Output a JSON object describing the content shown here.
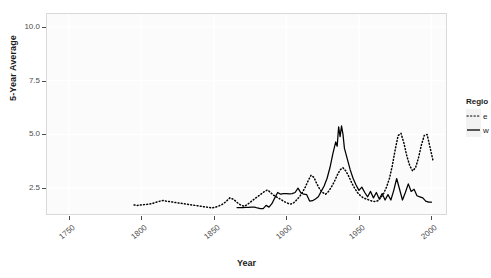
{
  "chart_data": {
    "type": "line",
    "title": "",
    "xlabel": "Year",
    "ylabel": "5-Year Average",
    "xlim": [
      1735,
      2010
    ],
    "ylim": [
      1.3,
      10.6
    ],
    "xticks": [
      1750,
      1800,
      1850,
      1900,
      1950,
      2000
    ],
    "yticks": [
      2.5,
      5.0,
      7.5,
      10.0
    ],
    "ytick_labels": [
      "2.5",
      "5.0",
      "7.5",
      "10.0"
    ],
    "grid": true,
    "legend_position": "right",
    "legend_title": "Regio",
    "series": [
      {
        "name": "e",
        "label": "e",
        "style": "dotted",
        "color": "#000000",
        "points": [
          [
            1795,
            1.72
          ],
          [
            1797,
            1.7
          ],
          [
            1799,
            1.71
          ],
          [
            1801,
            1.73
          ],
          [
            1803,
            1.74
          ],
          [
            1805,
            1.76
          ],
          [
            1807,
            1.78
          ],
          [
            1809,
            1.82
          ],
          [
            1811,
            1.86
          ],
          [
            1813,
            1.9
          ],
          [
            1815,
            1.93
          ],
          [
            1817,
            1.9
          ],
          [
            1819,
            1.88
          ],
          [
            1821,
            1.86
          ],
          [
            1823,
            1.84
          ],
          [
            1825,
            1.82
          ],
          [
            1827,
            1.8
          ],
          [
            1829,
            1.78
          ],
          [
            1831,
            1.76
          ],
          [
            1833,
            1.74
          ],
          [
            1835,
            1.72
          ],
          [
            1837,
            1.7
          ],
          [
            1839,
            1.68
          ],
          [
            1841,
            1.66
          ],
          [
            1843,
            1.64
          ],
          [
            1845,
            1.62
          ],
          [
            1847,
            1.6
          ],
          [
            1849,
            1.58
          ],
          [
            1851,
            1.62
          ],
          [
            1853,
            1.66
          ],
          [
            1855,
            1.72
          ],
          [
            1857,
            1.8
          ],
          [
            1859,
            1.92
          ],
          [
            1861,
            2.05
          ],
          [
            1863,
            2.0
          ],
          [
            1865,
            1.9
          ],
          [
            1867,
            1.78
          ],
          [
            1869,
            1.7
          ],
          [
            1871,
            1.66
          ],
          [
            1873,
            1.74
          ],
          [
            1875,
            1.84
          ],
          [
            1877,
            1.95
          ],
          [
            1879,
            2.05
          ],
          [
            1881,
            2.15
          ],
          [
            1883,
            2.25
          ],
          [
            1885,
            2.35
          ],
          [
            1887,
            2.42
          ],
          [
            1889,
            2.3
          ],
          [
            1891,
            2.18
          ],
          [
            1893,
            2.1
          ],
          [
            1895,
            2.02
          ],
          [
            1897,
            1.94
          ],
          [
            1899,
            1.86
          ],
          [
            1901,
            1.8
          ],
          [
            1903,
            1.76
          ],
          [
            1905,
            1.82
          ],
          [
            1907,
            1.95
          ],
          [
            1909,
            2.1
          ],
          [
            1911,
            2.3
          ],
          [
            1913,
            2.55
          ],
          [
            1915,
            2.85
          ],
          [
            1917,
            3.1
          ],
          [
            1919,
            3.0
          ],
          [
            1921,
            2.7
          ],
          [
            1923,
            2.45
          ],
          [
            1925,
            2.3
          ],
          [
            1927,
            2.22
          ],
          [
            1929,
            2.35
          ],
          [
            1931,
            2.55
          ],
          [
            1933,
            2.8
          ],
          [
            1935,
            3.1
          ],
          [
            1937,
            3.35
          ],
          [
            1939,
            3.45
          ],
          [
            1941,
            3.3
          ],
          [
            1943,
            3.05
          ],
          [
            1945,
            2.75
          ],
          [
            1947,
            2.5
          ],
          [
            1949,
            2.3
          ],
          [
            1951,
            2.15
          ],
          [
            1953,
            2.05
          ],
          [
            1955,
            2.0
          ],
          [
            1957,
            1.95
          ],
          [
            1959,
            1.9
          ],
          [
            1961,
            1.88
          ],
          [
            1963,
            1.92
          ],
          [
            1965,
            2.05
          ],
          [
            1967,
            2.25
          ],
          [
            1969,
            2.55
          ],
          [
            1971,
            2.95
          ],
          [
            1973,
            3.55
          ],
          [
            1975,
            4.3
          ],
          [
            1977,
            4.95
          ],
          [
            1979,
            5.05
          ],
          [
            1981,
            4.6
          ],
          [
            1983,
            4.0
          ],
          [
            1985,
            3.55
          ],
          [
            1987,
            3.3
          ],
          [
            1989,
            3.45
          ],
          [
            1991,
            3.9
          ],
          [
            1993,
            4.5
          ],
          [
            1995,
            4.95
          ],
          [
            1997,
            5.0
          ],
          [
            1999,
            4.4
          ],
          [
            2001,
            3.8
          ]
        ]
      },
      {
        "name": "w",
        "label": "w",
        "style": "solid",
        "color": "#000000",
        "points": [
          [
            1866,
            1.6
          ],
          [
            1868,
            1.6
          ],
          [
            1870,
            1.6
          ],
          [
            1872,
            1.61
          ],
          [
            1874,
            1.61
          ],
          [
            1876,
            1.62
          ],
          [
            1878,
            1.62
          ],
          [
            1880,
            1.58
          ],
          [
            1882,
            1.55
          ],
          [
            1884,
            1.55
          ],
          [
            1886,
            1.7
          ],
          [
            1888,
            1.62
          ],
          [
            1890,
            1.78
          ],
          [
            1892,
            2.05
          ],
          [
            1894,
            2.3
          ],
          [
            1896,
            2.22
          ],
          [
            1898,
            2.25
          ],
          [
            1900,
            2.25
          ],
          [
            1902,
            2.24
          ],
          [
            1904,
            2.25
          ],
          [
            1906,
            2.3
          ],
          [
            1908,
            2.5
          ],
          [
            1910,
            2.28
          ],
          [
            1912,
            2.22
          ],
          [
            1914,
            2.2
          ],
          [
            1916,
            1.9
          ],
          [
            1918,
            1.92
          ],
          [
            1920,
            2.0
          ],
          [
            1922,
            2.1
          ],
          [
            1924,
            2.35
          ],
          [
            1926,
            2.6
          ],
          [
            1928,
            2.95
          ],
          [
            1930,
            3.45
          ],
          [
            1932,
            4.1
          ],
          [
            1934,
            4.65
          ],
          [
            1935,
            4.45
          ],
          [
            1936,
            5.35
          ],
          [
            1937,
            4.9
          ],
          [
            1938,
            5.4
          ],
          [
            1939,
            5.0
          ],
          [
            1940,
            4.35
          ],
          [
            1942,
            3.85
          ],
          [
            1944,
            3.35
          ],
          [
            1946,
            2.95
          ],
          [
            1948,
            2.65
          ],
          [
            1950,
            2.4
          ],
          [
            1952,
            2.55
          ],
          [
            1954,
            2.3
          ],
          [
            1956,
            2.1
          ],
          [
            1958,
            2.35
          ],
          [
            1960,
            2.05
          ],
          [
            1962,
            2.3
          ],
          [
            1964,
            2.0
          ],
          [
            1966,
            2.25
          ],
          [
            1968,
            1.95
          ],
          [
            1970,
            2.2
          ],
          [
            1972,
            1.95
          ],
          [
            1974,
            2.4
          ],
          [
            1976,
            2.95
          ],
          [
            1978,
            2.45
          ],
          [
            1980,
            1.95
          ],
          [
            1982,
            2.3
          ],
          [
            1984,
            2.7
          ],
          [
            1986,
            2.35
          ],
          [
            1988,
            2.45
          ],
          [
            1990,
            2.15
          ],
          [
            1992,
            2.1
          ],
          [
            1994,
            2.05
          ],
          [
            1996,
            1.9
          ],
          [
            1998,
            1.85
          ],
          [
            2000,
            1.85
          ]
        ]
      }
    ]
  }
}
